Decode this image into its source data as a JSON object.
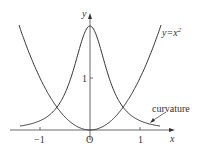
{
  "chart_data": {
    "type": "line",
    "title": "",
    "xlabel": "x",
    "ylabel": "y",
    "xlim": [
      -1.6,
      1.55
    ],
    "ylim": [
      0,
      2.2
    ],
    "x_ticks": [
      "-1",
      "1"
    ],
    "y_ticks": [
      "1"
    ],
    "origin_label": "O",
    "grid": false,
    "series": [
      {
        "name": "y=x²",
        "label": "y=x",
        "label_sup": "2",
        "function": "x^2",
        "x": [
          -1.4,
          -1,
          -0.5,
          0,
          0.5,
          1,
          1.4
        ],
        "values": [
          1.96,
          1,
          0.25,
          0,
          0.25,
          1,
          1.96
        ]
      },
      {
        "name": "curvature",
        "label": "curvature",
        "function": "2/(1+4x^2)^1.5",
        "x": [
          -1.4,
          -1,
          -0.5,
          0,
          0.5,
          1,
          1.4
        ],
        "values": [
          0.078,
          0.179,
          0.707,
          2,
          0.707,
          0.179,
          0.078
        ]
      }
    ]
  },
  "labels": {
    "x_axis": "x",
    "y_axis": "y",
    "origin": "O",
    "tick_neg1": "−1",
    "tick_1": "1",
    "tick_y1": "1",
    "parabola": "y=x",
    "parabola_sup": "2",
    "curvature": "curvature"
  },
  "colors": {
    "line": "#333333",
    "background": "#ffffff"
  }
}
